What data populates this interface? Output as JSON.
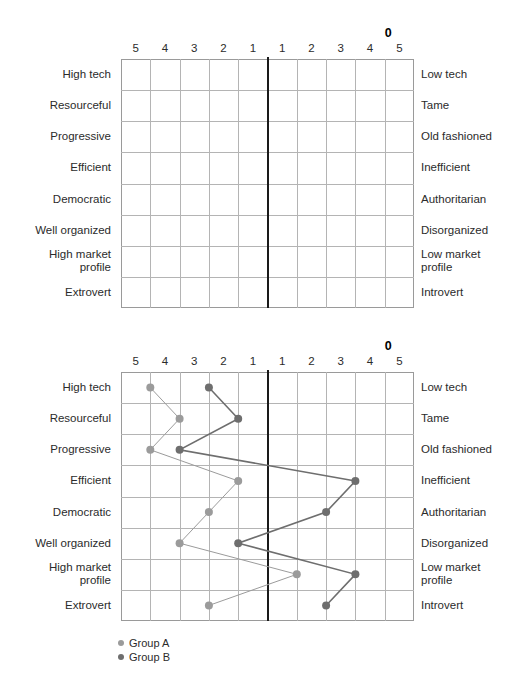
{
  "chart_data": {
    "type": "line",
    "title": "",
    "subtitle": "",
    "xlabel": "",
    "ylabel": "",
    "orientation": "horizontal",
    "grid": true,
    "legend_position": "bottom-left",
    "axis": {
      "zero_label": "0",
      "tick_labels": [
        "5",
        "4",
        "3",
        "2",
        "1",
        "1",
        "2",
        "3",
        "4",
        "5"
      ],
      "xlim": [
        -5,
        5
      ],
      "scale_points": 10
    },
    "categories": [
      "High tech",
      "Resourceful",
      "Progressive",
      "Efficient",
      "Democratic",
      "Well organized",
      "High market profile",
      "Extrovert"
    ],
    "categories_left": [
      "High tech",
      "Resourceful",
      "Progressive",
      "Efficient",
      "Democratic",
      "Well organized",
      "High market\nprofile",
      "Extrovert"
    ],
    "categories_right": [
      "Low tech",
      "Tame",
      "Old fashioned",
      "Inefficient",
      "Authoritarian",
      "Disorganized",
      "Low market\nprofile",
      "Introvert"
    ],
    "series": [
      {
        "name": "Group A",
        "color": "#9b9b9b",
        "values": [
          -4,
          -3,
          -4,
          -1,
          -2,
          -3,
          1,
          -2
        ]
      },
      {
        "name": "Group B",
        "color": "#6e6e6e",
        "values": [
          -2,
          -1,
          -3,
          3,
          2,
          -1,
          3,
          2
        ]
      }
    ]
  },
  "charts": [
    {
      "id": "blank",
      "has_series": false
    },
    {
      "id": "plotted",
      "has_series": true
    }
  ],
  "legend": {
    "items": [
      {
        "label": "Group A",
        "color": "#9b9b9b"
      },
      {
        "label": "Group B",
        "color": "#6e6e6e"
      }
    ]
  },
  "colors": {
    "grid_line": "#b4b4b4",
    "grid_border": "#9a9a9a",
    "zero_axis": "#1a1a1a",
    "text": "#2b2b2b",
    "group_a": "#9b9b9b",
    "group_b": "#6e6e6e"
  }
}
